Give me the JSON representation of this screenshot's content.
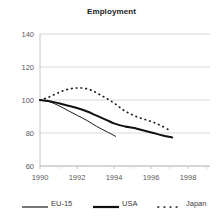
{
  "chart_data": {
    "type": "line",
    "title": "Employment",
    "xlabel": "",
    "ylabel": "",
    "xlim": [
      1990,
      1999
    ],
    "ylim": [
      60,
      140
    ],
    "xticks": [
      1990,
      1992,
      1994,
      1996,
      1998
    ],
    "yticks": [
      60,
      80,
      100,
      120,
      140
    ],
    "grid": "horizontal",
    "legend_position": "bottom",
    "note": "Index, 1990 = 100",
    "series": [
      {
        "name": "EU-15",
        "style": "thin-solid",
        "color": "#1a1a1a",
        "x": [
          1990,
          1990.5,
          1991,
          1991.5,
          1992,
          1992.5,
          1993,
          1993.5,
          1994
        ],
        "values": [
          100.0,
          99.0,
          96.5,
          93.5,
          90.5,
          87.5,
          84.0,
          81.0,
          78.0
        ]
      },
      {
        "name": "USA",
        "style": "thick-solid",
        "color": "#111111",
        "x": [
          1990,
          1990.5,
          1991,
          1991.5,
          1992,
          1992.5,
          1993,
          1993.5,
          1994,
          1994.5,
          1995,
          1995.5,
          1996,
          1996.5,
          1997
        ],
        "values": [
          100.0,
          99.3,
          98.0,
          96.5,
          95.0,
          93.0,
          90.5,
          88.0,
          85.5,
          84.0,
          83.0,
          81.5,
          80.0,
          78.5,
          77.3
        ]
      },
      {
        "name": "Japan",
        "style": "dotted",
        "color": "#1a1a1a",
        "x": [
          1990,
          1990.4,
          1990.8,
          1991.2,
          1991.6,
          1992,
          1992.4,
          1992.8,
          1993.2,
          1993.6,
          1994,
          1994.4,
          1994.8,
          1995.2,
          1995.6,
          1996,
          1996.4,
          1996.8
        ],
        "values": [
          100.0,
          101.5,
          103.5,
          105.5,
          106.8,
          107.3,
          107.0,
          105.5,
          103.0,
          100.5,
          97.5,
          94.0,
          91.5,
          89.5,
          88.0,
          86.5,
          84.5,
          82.0
        ]
      }
    ]
  },
  "legend": {
    "items": [
      {
        "label": "EU-15",
        "style": "thin-solid"
      },
      {
        "label": "USA",
        "style": "thick-solid"
      },
      {
        "label": "Japan",
        "style": "dotted"
      }
    ]
  },
  "colors": {
    "gridline": "#d9d9d9",
    "axis": "#c9c9c9",
    "text": "#5a5a5a",
    "title": "#1a1a1a",
    "series": "#1a1a1a"
  }
}
